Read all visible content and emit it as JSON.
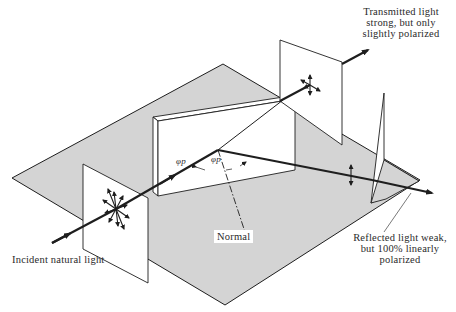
{
  "diagram": {
    "labels": {
      "transmitted": [
        "Transmitted light",
        "strong, but only",
        "slightly polarized"
      ],
      "reflected": [
        "Reflected light weak,",
        "but 100% linearly",
        "polarized"
      ],
      "incident": "Incident natural light",
      "normal": "Normal",
      "angle_incident": "φp",
      "angle_reflected": "φp"
    },
    "colors": {
      "ground": "#d4d4d4",
      "stroke": "#1e1e1e",
      "screen": "#ffffff",
      "text": "#2a2a2a"
    },
    "elements": {
      "ground_plane": "gray parallelogram base",
      "glass_slab": "reflecting dielectric plate",
      "incident_screen": "screen showing unpolarized light (star of arrows)",
      "transmitted_screen": "screen showing partially polarized light",
      "reflected_screen": "screen showing vertically polarized light",
      "normal_line": "dash-dot normal to surface"
    }
  }
}
